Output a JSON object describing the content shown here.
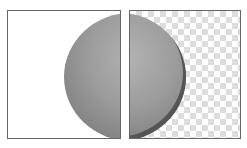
{
  "panels": [
    {
      "name": "original",
      "background": "white"
    },
    {
      "name": "transparent",
      "background": "checkerboard"
    }
  ],
  "colors": {
    "ball": "#9c9c9c",
    "border": "#666666",
    "checker": "#dddddd"
  }
}
